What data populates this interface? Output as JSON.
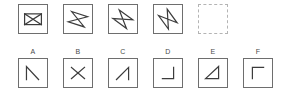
{
  "puzzle": {
    "type": "visual-sequence-reasoning",
    "stroke_color": "#3c3c3c",
    "box_border_color": "#6e6e6e",
    "dashed_border_color": "#b4b4b4",
    "background_color": "#ffffff",
    "label_color": "#4a4a4a"
  },
  "sequence": {
    "name": "sequence-row",
    "cells": [
      {
        "id": "sequence-cell-1",
        "border": "solid",
        "shape_name": "rectangle-with-x-bowtie",
        "description": "Rectangle outline with an X crossing inside",
        "rotation_deg": 0
      },
      {
        "id": "sequence-cell-2",
        "border": "solid",
        "shape_name": "bowtie-rotated-1",
        "description": "Bowtie / hourglass figure rotated slightly",
        "rotation_deg": 18
      },
      {
        "id": "sequence-cell-3",
        "border": "solid",
        "shape_name": "bowtie-rotated-2",
        "description": "Bowtie / hourglass figure rotated further",
        "rotation_deg": 36
      },
      {
        "id": "sequence-cell-4",
        "border": "solid",
        "shape_name": "bowtie-rotated-3",
        "description": "Bowtie / hourglass figure rotated further still",
        "rotation_deg": 54
      },
      {
        "id": "sequence-cell-5-missing",
        "border": "dashed",
        "shape_name": "empty-answer-slot",
        "description": "Empty dashed box marking the missing element",
        "rotation_deg": null
      }
    ]
  },
  "options": {
    "name": "options-row",
    "items": [
      {
        "label": "A",
        "shape_name": "caret-angle",
        "description": "Vertical left stroke with diagonal descending to the right"
      },
      {
        "label": "B",
        "shape_name": "x-cross",
        "description": "Two crossing diagonal strokes forming an X"
      },
      {
        "label": "C",
        "shape_name": "diagonal-with-riser",
        "description": "Rising diagonal stroke joined to a short vertical riser on the right"
      },
      {
        "label": "D",
        "shape_name": "corner-bottom-right",
        "description": "Right vertical stroke meeting a horizontal stroke at the bottom"
      },
      {
        "label": "E",
        "shape_name": "right-triangle",
        "description": "Right triangle outline pointing to the right"
      },
      {
        "label": "F",
        "shape_name": "corner-top-left",
        "description": "Left vertical stroke meeting a horizontal stroke at the top"
      }
    ]
  }
}
